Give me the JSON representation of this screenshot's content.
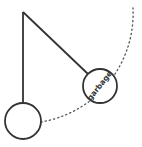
{
  "diagram": {
    "type": "pendulum",
    "colors": {
      "stroke": "#333333",
      "background": "#ffffff",
      "dotted": "#555555"
    },
    "pivot": {
      "x": 23,
      "y": 12
    },
    "pendulums": [
      {
        "id": "rest",
        "bob_center": {
          "x": 23,
          "y": 121
        },
        "bob_radius": 18,
        "label": ""
      },
      {
        "id": "swung",
        "bob_center": {
          "x": 100,
          "y": 86
        },
        "bob_radius": 17,
        "label": "garbage"
      }
    ],
    "arc": {
      "style": "dotted",
      "description": "swing path"
    }
  }
}
